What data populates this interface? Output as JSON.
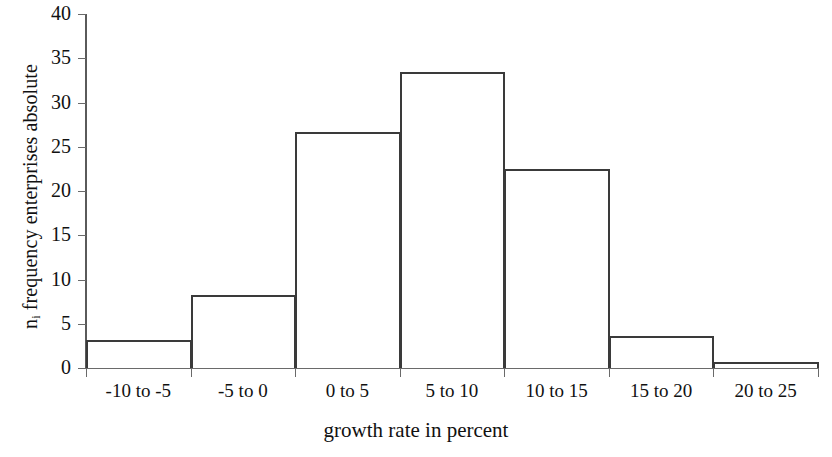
{
  "chart_data": {
    "type": "bar",
    "title": "",
    "subtitle": "",
    "xlabel": "growth rate in percent",
    "ylabel": "n  frequency enterprises absolute",
    "ylabel_prefix": "n",
    "ylabel_subscript": "i",
    "ylabel_rest": " frequency enterprises absolute",
    "categories": [
      "-10 to -5",
      "-5 to 0",
      "0 to 5",
      "5 to 10",
      "10 to 15",
      "15 to 20",
      "20 to 25"
    ],
    "values": [
      3.2,
      8.2,
      26.7,
      33.5,
      22.5,
      3.6,
      0.7
    ],
    "ylim": [
      0,
      40
    ],
    "xlim": [
      -10,
      25
    ],
    "y_ticks": [
      0,
      5,
      10,
      15,
      20,
      25,
      30,
      35,
      40
    ],
    "y_tick_labels": [
      "0",
      "5",
      "10",
      "15",
      "20",
      "25",
      "30",
      "35",
      "40"
    ],
    "grid": false,
    "legend": false,
    "legend_position": "none",
    "bar_style": "outlined-histogram",
    "bar_fill_color": "#ffffff",
    "bar_edge_color": "#3a3a3a",
    "axis_color": "#6a6a6a",
    "background_color": "#ffffff",
    "text_color": "#111111"
  }
}
